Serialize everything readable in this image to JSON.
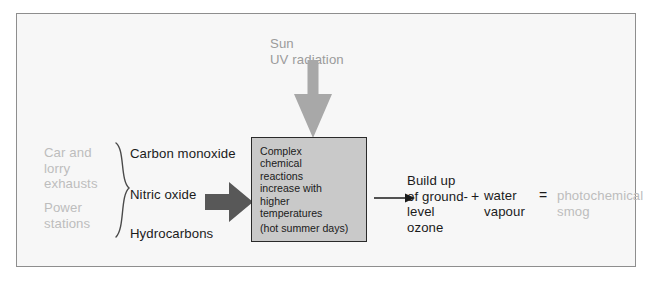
{
  "diagram": {
    "sun": {
      "label": "Sun\nUV radiation",
      "arrow_icon": "down-arrow-icon",
      "color": "#a8a8a8"
    },
    "sources": [
      {
        "id": "vehicles",
        "label": "Car and\nlorry\nexhausts",
        "color": "#bdbdbd"
      },
      {
        "id": "power",
        "label": "Power\nstations",
        "color": "#bdbdbd"
      }
    ],
    "brace_icon": "curly-brace-icon",
    "pollutants": [
      {
        "id": "carbon-monoxide",
        "label": "Carbon monoxide"
      },
      {
        "id": "nitric-oxide",
        "label": "Nitric oxide"
      },
      {
        "id": "hydrocarbons",
        "label": "Hydrocarbons"
      }
    ],
    "big_arrow_icon": "right-block-arrow-icon",
    "big_arrow_color": "#585858",
    "reaction_box": {
      "main_text": "Complex\nchemical\nreactions\nincrease with\nhigher\ntemperatures",
      "sub_text": "(hot summer days)",
      "fill": "#c9c9c9",
      "border": "#2a2a2a"
    },
    "thin_arrow_icon": "right-line-arrow-icon",
    "outcome": {
      "ozone": "Build up\nof ground-\nlevel\nozone",
      "plus": "+",
      "water": "water\nvapour",
      "equals": "=",
      "smog": "photochemical\nsmog",
      "smog_color": "#bdbdbd"
    },
    "frame": {
      "background": "#f7f7f7",
      "border_color": "#8e8e8e"
    }
  }
}
